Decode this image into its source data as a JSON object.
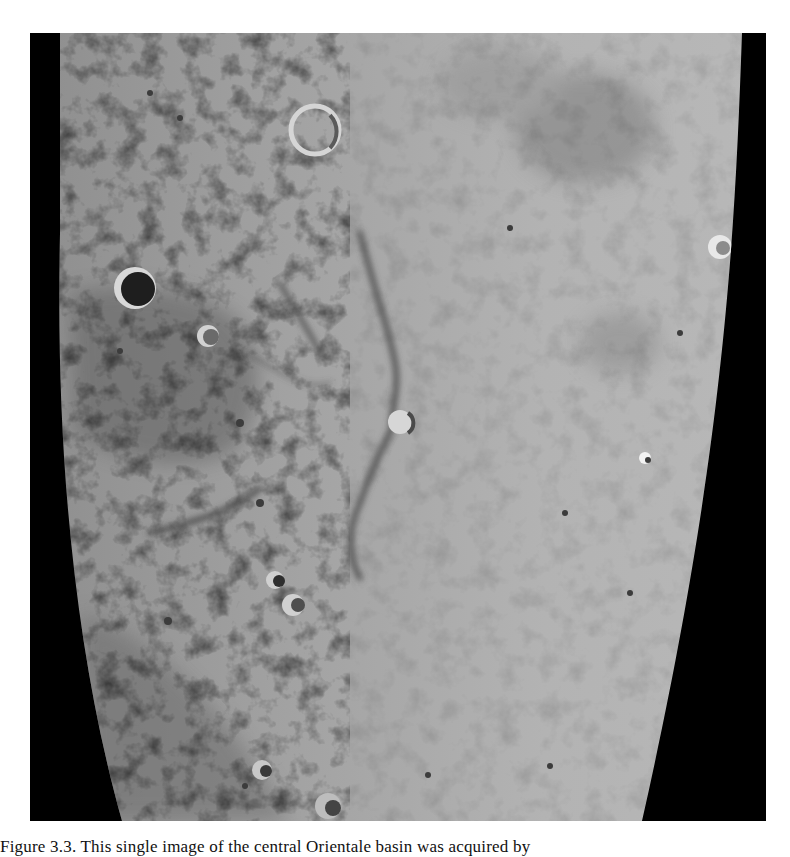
{
  "figure": {
    "colors": {
      "space": "#000000",
      "surface_light": "#b4b4b4",
      "surface_mid": "#9a9a9a",
      "mare_dark": "#7a7a7a",
      "page": "#ffffff"
    },
    "features": [
      {
        "name": "large dark-floored crater",
        "x": 135,
        "y": 288
      },
      {
        "name": "crater",
        "x": 208,
        "y": 336
      },
      {
        "name": "upper crater",
        "x": 315,
        "y": 130
      },
      {
        "name": "central crater",
        "x": 400,
        "y": 422
      },
      {
        "name": "bright right crater",
        "x": 720,
        "y": 247
      },
      {
        "name": "bright spot",
        "x": 645,
        "y": 458
      },
      {
        "name": "crater pair",
        "x": 275,
        "y": 580
      },
      {
        "name": "crater",
        "x": 293,
        "y": 605
      },
      {
        "name": "bottom crater",
        "x": 262,
        "y": 770
      }
    ]
  },
  "caption": {
    "text": "Figure 3.3. This single image of the central Orientale basin was acquired by"
  }
}
